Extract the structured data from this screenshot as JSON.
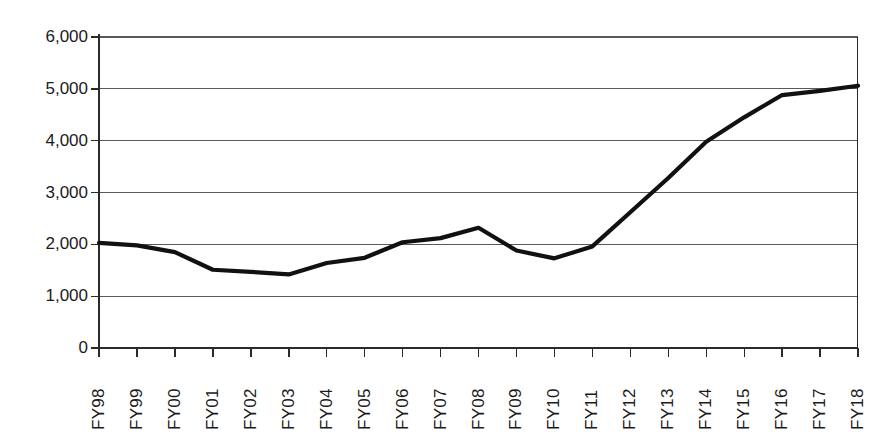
{
  "chart_data": {
    "type": "line",
    "title": "",
    "xlabel": "",
    "ylabel": "",
    "categories": [
      "FY98",
      "FY99",
      "FY00",
      "FY01",
      "FY02",
      "FY03",
      "FY04",
      "FY05",
      "FY06",
      "FY07",
      "FY08",
      "FY09",
      "FY10",
      "FY11",
      "FY12",
      "FY13",
      "FY14",
      "FY15",
      "FY16",
      "FY17",
      "FY18"
    ],
    "values": [
      2030,
      1980,
      1850,
      1510,
      1470,
      1420,
      1640,
      1740,
      2040,
      2120,
      2320,
      1880,
      1730,
      1960,
      2620,
      3280,
      3980,
      4450,
      4880,
      4960,
      5060
    ],
    "ylim": [
      0,
      6000
    ],
    "y_ticks": [
      0,
      1000,
      2000,
      3000,
      4000,
      5000,
      6000
    ],
    "y_tick_labels": [
      "0",
      "1,000",
      "2,000",
      "3,000",
      "4,000",
      "5,000",
      "6,000"
    ],
    "grid": true,
    "legend": false,
    "series_color": "#111111",
    "grid_color": "#5a5a5a",
    "axis_color": "#2a2a2a"
  },
  "axes": {
    "y_label_texts": [
      "6,000",
      "5,000",
      "4,000",
      "3,000",
      "2,000",
      "1,000",
      "0"
    ],
    "x_label_texts": [
      "FY98",
      "FY99",
      "FY00",
      "FY01",
      "FY02",
      "FY03",
      "FY04",
      "FY05",
      "FY06",
      "FY07",
      "FY08",
      "FY09",
      "FY10",
      "FY11",
      "FY12",
      "FY13",
      "FY14",
      "FY15",
      "FY16",
      "FY17",
      "FY18"
    ]
  },
  "page": {
    "title_strip": ""
  }
}
